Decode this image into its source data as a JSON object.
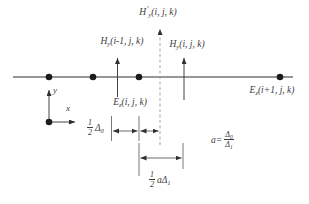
{
  "colors": {
    "background": "#ffffff",
    "line": "#2f2f2f",
    "dashed_line": "#9b9b9b",
    "dot": "#1c1c1c",
    "text": "#3c3c3c"
  },
  "field_labels": {
    "hy_prime": {
      "base": "H",
      "prime": "′",
      "sub": "y",
      "args": "(i, j, k)"
    },
    "hy_left": {
      "base": "H",
      "sub": "y",
      "args": "(i-1, j, k)"
    },
    "hy_right": {
      "base": "H",
      "sub": "y",
      "args": "(i, j, k)"
    },
    "ez_center": {
      "base": "E",
      "sub": "z",
      "args": "(i, j, k)"
    },
    "ez_right": {
      "base": "E",
      "sub": "z",
      "args": "(i+1, j, k)"
    }
  },
  "axes": {
    "x_label": "x",
    "y_label": "y"
  },
  "dimensions": {
    "half_delta0": {
      "num": "1",
      "den": "2",
      "coef": "",
      "sym": "Δ",
      "sym_sub": "0"
    },
    "half_a_delta1": {
      "num": "1",
      "den": "2",
      "coef": "a",
      "sym": "Δ",
      "sym_sub": "1"
    },
    "ratio": {
      "lhs": "a",
      "eq": "=",
      "num_sym": "Δ",
      "num_sub": "0",
      "den_sym": "Δ",
      "den_sub": "1"
    }
  }
}
